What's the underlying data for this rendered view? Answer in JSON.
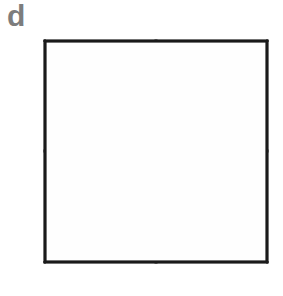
{
  "figure": {
    "panel_label": "d",
    "label_color": "#7d7d7d",
    "background_color": "#ffffff",
    "line_color": "#1a1a1a",
    "fill_color": "#fefefe",
    "shaded_color": "#8a8a8a",
    "square": {
      "x": 45,
      "y": 41,
      "width": 222,
      "height": 221,
      "center_x": 156,
      "center_y": 151
    },
    "total_parts": 8,
    "shaded_parts": 1,
    "shaded_triangle": {
      "name": "upper-left-lower-half",
      "points": "45,41 45,151 156,151"
    },
    "segments": [
      {
        "name": "vertical-midline",
        "x1": 156,
        "y1": 41,
        "x2": 156,
        "y2": 262
      },
      {
        "name": "horizontal-midline",
        "x1": 45,
        "y1": 151,
        "x2": 267,
        "y2": 151
      },
      {
        "name": "main-diagonal",
        "x1": 45,
        "y1": 41,
        "x2": 267,
        "y2": 262
      },
      {
        "name": "anti-diagonal",
        "x1": 267,
        "y1": 41,
        "x2": 45,
        "y2": 262
      }
    ]
  }
}
